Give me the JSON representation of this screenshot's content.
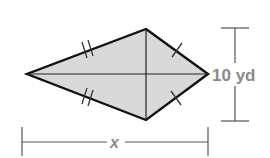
{
  "figure": {
    "type": "kite",
    "fill_color": "#d9d9d9",
    "stroke_color": "#111111",
    "label_color": "#8a8a8a",
    "vertices": {
      "top": [
        146,
        29
      ],
      "right": [
        208,
        74
      ],
      "bottom": [
        146,
        120
      ],
      "left": [
        27,
        74
      ]
    },
    "congruence_marks": {
      "left_sides": "double",
      "right_sides": "single"
    }
  },
  "dimensions": {
    "vertical_diagonal": {
      "label": "10 yd"
    },
    "horizontal_diagonal": {
      "label": "x"
    }
  }
}
